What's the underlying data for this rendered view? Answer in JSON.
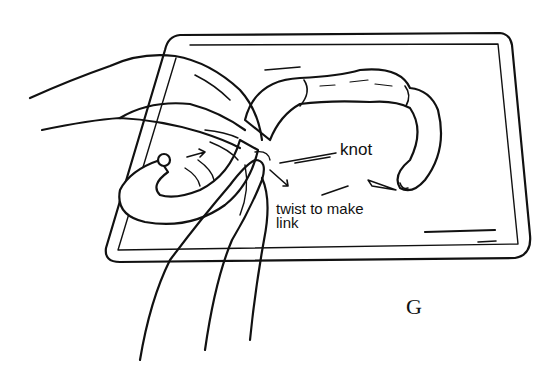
{
  "illustration": {
    "subject": "hands twisting a sausage link on a baking tray",
    "labels": {
      "knot": "knot",
      "twist_line1": "twist to make",
      "twist_line2": "link",
      "figure_letter": "G"
    },
    "colors": {
      "ink": "#111111",
      "background": "#ffffff"
    }
  }
}
